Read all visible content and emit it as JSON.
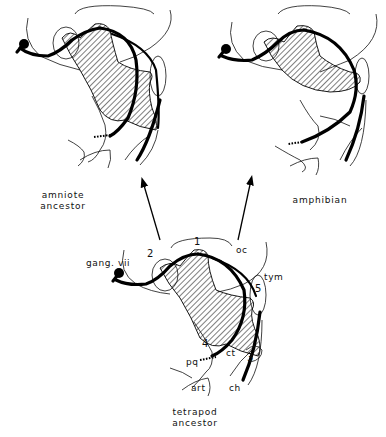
{
  "figure": {
    "panels": [
      {
        "id": "amniote-ancestor",
        "caption_line1": "amniote",
        "caption_line2": "ancestor"
      },
      {
        "id": "amphibian",
        "caption_line1": "amphibian"
      },
      {
        "id": "tetrapod-ancestor",
        "caption_line1": "tetrapod",
        "caption_line2": "ancestor"
      }
    ],
    "labels": {
      "gang": "gang. vii",
      "oc": "oc",
      "tym": "tym",
      "pq": "pq",
      "ct": "ct",
      "art": "art",
      "ch": "ch",
      "n1": "1",
      "n2": "2",
      "n3": "3",
      "n4": "4",
      "n5": "5"
    },
    "arrows": [
      {
        "from": "tetrapod-ancestor",
        "to": "amniote-ancestor"
      },
      {
        "from": "tetrapod-ancestor",
        "to": "amphibian"
      }
    ]
  }
}
